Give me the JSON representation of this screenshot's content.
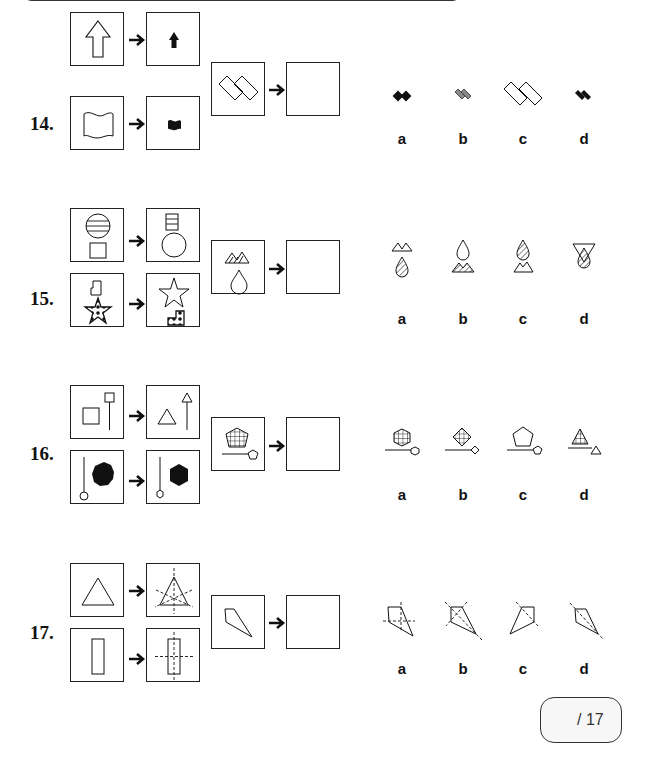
{
  "page": {
    "type": "visual reasoning worksheet",
    "score": {
      "label": "/ 17"
    }
  },
  "questions": [
    {
      "number": "14.",
      "examples": [
        {
          "input": "outline-up-arrow",
          "output": "small-black-up-arrow"
        },
        {
          "input": "outline-wavy-flag",
          "output": "small-black-wavy-flag"
        }
      ],
      "query": "two-overlapping-outline-rectangles-diagonal",
      "answer_box": "empty",
      "options": [
        {
          "label": "a",
          "desc": "small black overlapping rectangles (tilted up)"
        },
        {
          "label": "b",
          "desc": "small grey overlapping rectangles"
        },
        {
          "label": "c",
          "desc": "large outline overlapping rectangles"
        },
        {
          "label": "d",
          "desc": "small black overlapping rectangles"
        }
      ]
    },
    {
      "number": "15.",
      "examples": [
        {
          "input": "striped-circle-above-square",
          "output": "striped-square-above-circle"
        },
        {
          "input": "L-shape-above-dotted-star",
          "output": "star-above-dotted-L-shape"
        }
      ],
      "query": "mountains-above-drop",
      "answer_box": "empty",
      "options": [
        {
          "label": "a",
          "desc": "plain mountains above striped drop"
        },
        {
          "label": "b",
          "desc": "plain drop above striped mountains"
        },
        {
          "label": "c",
          "desc": "striped drop above plain mountains"
        },
        {
          "label": "d",
          "desc": "inverted triangle with striped drop"
        }
      ]
    },
    {
      "number": "16.",
      "examples": [
        {
          "input": "square-with-square-pin",
          "output": "triangle-with-triangle-pin"
        },
        {
          "input": "black-octagon-with-circle-pin",
          "output": "black-hexagon-with-hexagon-pin"
        }
      ],
      "query": "gridded-pentagon-with-pentagon-pin",
      "answer_box": "empty",
      "options": [
        {
          "label": "a",
          "desc": "gridded hexagon with hexagon pin"
        },
        {
          "label": "b",
          "desc": "gridded diamond with diamond pin"
        },
        {
          "label": "c",
          "desc": "plain pentagon with pentagon pin"
        },
        {
          "label": "d",
          "desc": "gridded triangle with triangle pin"
        }
      ]
    },
    {
      "number": "17.",
      "examples": [
        {
          "input": "triangle",
          "output": "triangle-with-3-symmetry-axes"
        },
        {
          "input": "rectangle",
          "output": "rectangle-with-2-symmetry-axes"
        }
      ],
      "query": "kite-quadrilateral",
      "answer_box": "empty",
      "options": [
        {
          "label": "a",
          "desc": "kite with cross axes"
        },
        {
          "label": "b",
          "desc": "kite with two diagonal axes"
        },
        {
          "label": "c",
          "desc": "mirrored kite with axis"
        },
        {
          "label": "d",
          "desc": "kite with one diagonal axis"
        }
      ]
    }
  ]
}
